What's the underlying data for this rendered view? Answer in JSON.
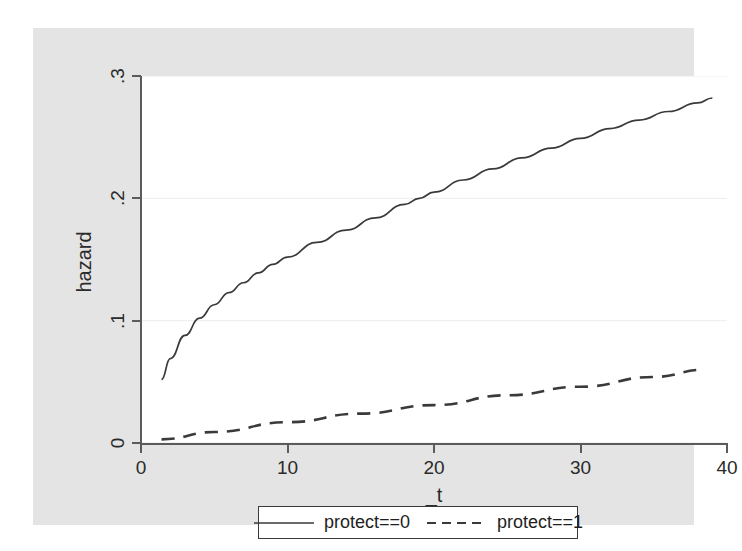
{
  "figure": {
    "background_color": "#e4e4e4",
    "plot_background_color": "#ffffff",
    "grid_color": "#f0f0f0",
    "axis_color": "#5b5b5b",
    "line_color": "#3a3a3a"
  },
  "axes": {
    "y_title": "hazard",
    "x_title": "_t",
    "y_ticks": [
      "0",
      ".1",
      ".2",
      ".3"
    ],
    "x_ticks": [
      "0",
      "10",
      "20",
      "30",
      "40"
    ]
  },
  "legend": {
    "entries": [
      {
        "label": "protect==0",
        "style": "solid",
        "key": "legend-key-solid"
      },
      {
        "label": "protect==1",
        "style": "dashed",
        "key": "legend-key-dashed"
      }
    ]
  },
  "chart_data": {
    "type": "line",
    "title": "",
    "subtitle": "",
    "xlabel": "_t",
    "ylabel": "hazard",
    "xlim": [
      0,
      40
    ],
    "ylim": [
      0,
      0.3
    ],
    "xticks": [
      0,
      10,
      20,
      30,
      40
    ],
    "yticks": [
      0,
      0.1,
      0.2,
      0.3
    ],
    "grid": true,
    "grid_axis": "y",
    "legend_position": "bottom",
    "series": [
      {
        "name": "protect==0",
        "style": "solid",
        "x": [
          1.4,
          2,
          3,
          4,
          5,
          6,
          7,
          8,
          9,
          10,
          12,
          14,
          16,
          18,
          19,
          20,
          22,
          24,
          26,
          28,
          30,
          32,
          34,
          36,
          38,
          39
        ],
        "values": [
          0.052,
          0.069,
          0.088,
          0.102,
          0.113,
          0.123,
          0.131,
          0.139,
          0.146,
          0.152,
          0.164,
          0.174,
          0.184,
          0.195,
          0.2,
          0.205,
          0.215,
          0.224,
          0.233,
          0.241,
          0.249,
          0.257,
          0.264,
          0.271,
          0.278,
          0.282
        ]
      },
      {
        "name": "protect==1",
        "style": "dashed",
        "x": [
          1.4,
          5,
          10,
          15,
          20,
          25,
          30,
          35,
          38.5
        ],
        "values": [
          0.003,
          0.009,
          0.017,
          0.024,
          0.031,
          0.039,
          0.046,
          0.054,
          0.06
        ]
      }
    ],
    "annotations": []
  }
}
